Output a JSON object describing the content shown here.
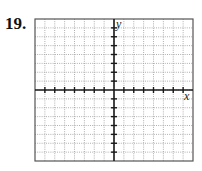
{
  "problem": {
    "number": "19."
  },
  "graph": {
    "x_axis_label": "x",
    "y_axis_label": "y",
    "x_range": [
      -8,
      8
    ],
    "y_range": [
      -8,
      8
    ],
    "grid_columns": 16,
    "grid_rows": 16,
    "grid_lines": "dotted",
    "tick_marks_on_axes": true,
    "plotted_content": "none (blank grid)",
    "colors": {
      "border": "#555555",
      "grid": "#9a9a9a",
      "axes": "#1a1a1a"
    }
  }
}
